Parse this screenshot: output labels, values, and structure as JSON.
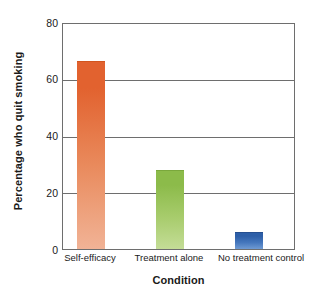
{
  "chart_data": {
    "type": "bar",
    "title": "",
    "xlabel": "Condition",
    "ylabel": "Percentage who quit smoking",
    "categories": [
      "Self-efficacy",
      "Treatment alone",
      "No treatment control"
    ],
    "values": [
      67,
      28,
      6
    ],
    "ylim": [
      0,
      80
    ],
    "yticks": [
      0,
      20,
      40,
      60,
      80
    ],
    "ytick_labels": [
      "0",
      "20",
      "40",
      "60",
      "80"
    ],
    "grid": true,
    "grid_axis": "y",
    "legend": false,
    "legend_position": "none",
    "bar_colors": [
      "#e2622f",
      "#8cbb4a",
      "#2d5fa8"
    ],
    "series": [
      {
        "name": "Percentage who quit smoking",
        "values": [
          67,
          28,
          6
        ]
      }
    ]
  },
  "axes": {
    "y_title": "Percentage who quit smoking",
    "x_title": "Condition",
    "y_ticks": [
      {
        "label": "80",
        "value": 80
      },
      {
        "label": "60",
        "value": 60
      },
      {
        "label": "40",
        "value": 40
      },
      {
        "label": "20",
        "value": 20
      },
      {
        "label": "0",
        "value": 0
      }
    ],
    "x_ticks": [
      {
        "label": "Self-efficacy"
      },
      {
        "label": "Treatment alone"
      },
      {
        "label": "No treatment control"
      }
    ]
  },
  "bars": [
    {
      "name": "Self-efficacy",
      "value": 67,
      "color": "#e2622f"
    },
    {
      "name": "Treatment alone",
      "value": 28,
      "color": "#8cbb4a"
    },
    {
      "name": "No treatment control",
      "value": 6,
      "color": "#2d5fa8"
    }
  ]
}
